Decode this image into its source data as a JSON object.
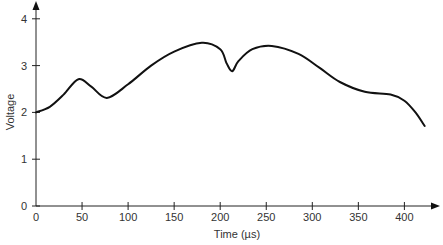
{
  "chart_data": {
    "type": "line",
    "title": "",
    "xlabel": "Time (µs)",
    "ylabel": "Voltage",
    "xlim": [
      0,
      435
    ],
    "ylim": [
      0,
      4.4
    ],
    "x_ticks": [
      0,
      50,
      100,
      150,
      200,
      250,
      300,
      350,
      400
    ],
    "y_ticks": [
      0,
      1,
      2,
      3,
      4
    ],
    "grid": false,
    "legend": null,
    "series": [
      {
        "name": "Voltage",
        "x": [
          0,
          15,
          30,
          46,
          60,
          77,
          100,
          125,
          150,
          180,
          200,
          207,
          213,
          220,
          235,
          256,
          285,
          308,
          330,
          357,
          385,
          400,
          412,
          422
        ],
        "values": [
          2.0,
          2.12,
          2.38,
          2.71,
          2.55,
          2.31,
          2.6,
          3.0,
          3.3,
          3.49,
          3.35,
          3.05,
          2.88,
          3.1,
          3.35,
          3.42,
          3.25,
          2.95,
          2.65,
          2.44,
          2.38,
          2.25,
          2.0,
          1.71
        ]
      }
    ]
  },
  "axes": {
    "x_label": "Time (µs)",
    "y_label": "Voltage",
    "x_tick_labels": [
      "0",
      "50",
      "100",
      "150",
      "200",
      "250",
      "300",
      "350",
      "400"
    ],
    "y_tick_labels": [
      "0",
      "1",
      "2",
      "3",
      "4"
    ]
  },
  "colors": {
    "line": "#111111",
    "axis": "#222222",
    "text": "#333333",
    "background": "#ffffff"
  }
}
